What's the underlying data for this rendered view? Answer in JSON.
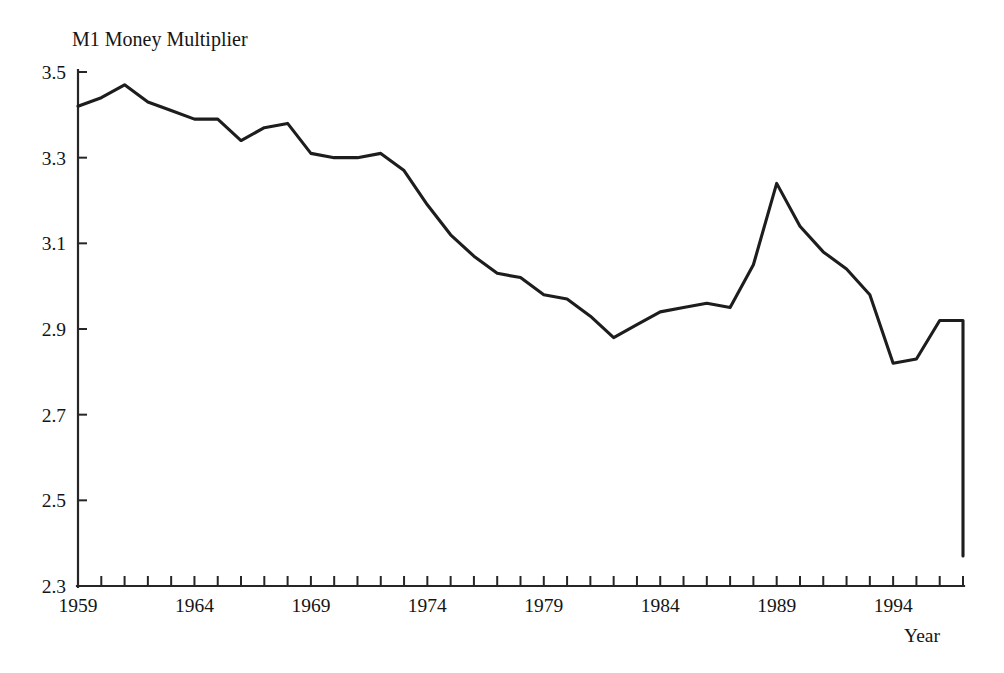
{
  "chart_data": {
    "type": "line",
    "title": "M1 Money Multiplier",
    "xlabel": "Year",
    "ylabel": "",
    "xlim": [
      1959,
      1997
    ],
    "ylim": [
      2.3,
      3.5
    ],
    "grid": false,
    "legend": null,
    "y_ticks": [
      3.5,
      3.3,
      3.1,
      2.9,
      2.7,
      2.5,
      2.3
    ],
    "y_tick_labels": [
      "3.5",
      "3.3",
      "3.1",
      "2.9",
      "2.7",
      "2.5",
      "2.3"
    ],
    "x_ticks": [
      1959,
      1964,
      1969,
      1974,
      1979,
      1984,
      1989,
      1994
    ],
    "x_tick_labels": [
      "1959",
      "1964",
      "1969",
      "1974",
      "1979",
      "1984",
      "1989",
      "1994"
    ],
    "x_minor_tick_interval": 1,
    "line_color": "#1d1d1d",
    "axis_color": "#262626",
    "background_color": "#ffffff",
    "x": [
      1959,
      1960,
      1961,
      1962,
      1963,
      1964,
      1965,
      1966,
      1967,
      1968,
      1969,
      1970,
      1971,
      1972,
      1973,
      1974,
      1975,
      1976,
      1977,
      1978,
      1979,
      1980,
      1981,
      1982,
      1983,
      1984,
      1985,
      1986,
      1987,
      1988,
      1989,
      1990,
      1991,
      1992,
      1993,
      1994,
      1995,
      1996,
      1997
    ],
    "y": [
      3.42,
      3.44,
      3.47,
      3.43,
      3.41,
      3.39,
      3.39,
      3.34,
      3.37,
      3.38,
      3.31,
      3.3,
      3.3,
      3.31,
      3.27,
      3.19,
      3.12,
      3.07,
      3.03,
      3.02,
      2.98,
      2.97,
      2.93,
      2.88,
      2.91,
      2.94,
      2.95,
      2.96,
      2.95,
      3.05,
      3.24,
      3.14,
      3.08,
      3.04,
      2.98,
      2.82,
      2.83,
      2.92,
      2.92
    ],
    "series_name": "M1 Money Multiplier",
    "note_start_value": 3.42,
    "note_peak_year": 1961,
    "note_peak_value": 3.47,
    "note_end_value": 2.37
  }
}
